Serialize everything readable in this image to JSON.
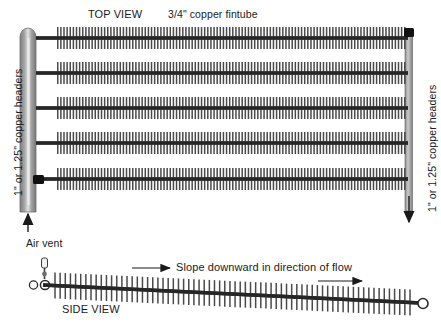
{
  "diagram": {
    "title_top": "TOP VIEW",
    "title_bottom": "SIDE VIEW",
    "fintube_label": "3/4\" copper fintube",
    "header_label_left": "1\" or 1.25\" copper headers",
    "header_label_right": "1\" or 1.25\" copper headers",
    "air_vent_label": "Air vent",
    "slope_label": "Slope downward in direction of flow",
    "colors": {
      "header_gray": "#8a8a8a",
      "header_highlight": "#d8d8d8",
      "tube_dark": "#262626",
      "fin_gray": "#4a4a4a",
      "connector_black": "#111111",
      "text": "#1a1a1a",
      "background": "#ffffff"
    },
    "top_view": {
      "fintube_row_count": 5,
      "fintube_rows_y": [
        38,
        73,
        108,
        143,
        179
      ],
      "fintube_x_start": 57,
      "fintube_x_end": 404,
      "fin_count_per_row": 112,
      "left_header_x": [
        20,
        36
      ],
      "left_header_y": [
        27,
        212
      ],
      "right_header_x": [
        405,
        412
      ],
      "right_header_y": [
        31,
        210
      ],
      "inlet_arrow": "up",
      "outlet_arrow": "down",
      "connector_blocks": 2
    },
    "side_view": {
      "tube_left_x": 48,
      "tube_left_y": 285,
      "tube_right_x": 420,
      "tube_right_y": 303,
      "fin_count": 70,
      "end_fitting": "circle",
      "air_vent_circles": 2,
      "flow_arrows": 2
    }
  }
}
